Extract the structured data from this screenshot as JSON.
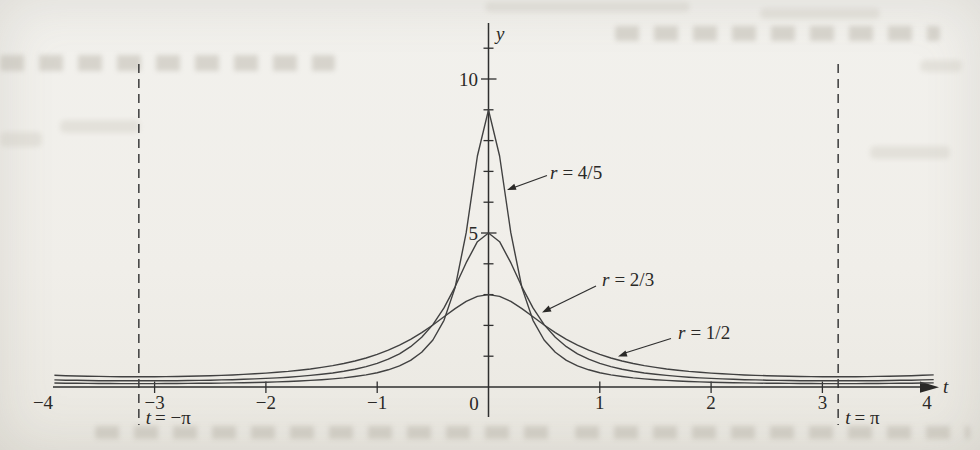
{
  "chart_data": {
    "type": "line",
    "title": "",
    "xlabel": "t",
    "ylabel": "y",
    "xlim": [
      -4,
      4
    ],
    "ylim": [
      0,
      11.8
    ],
    "grid": false,
    "legend_position": "inline-arrow-annotations",
    "x": [
      -4,
      -3.9,
      -3.8,
      -3.7,
      -3.6,
      -3.5,
      -3.4,
      -3.3,
      -3.2,
      -3.1,
      -3,
      -2.9,
      -2.8,
      -2.7,
      -2.6,
      -2.5,
      -2.4,
      -2.3,
      -2.2,
      -2.1,
      -2,
      -1.9,
      -1.8,
      -1.7,
      -1.6,
      -1.5,
      -1.4,
      -1.3,
      -1.2,
      -1.1,
      -1,
      -0.9,
      -0.8,
      -0.7,
      -0.6,
      -0.5,
      -0.4,
      -0.3,
      -0.2,
      -0.1,
      0,
      0.1,
      0.2,
      0.3,
      0.4,
      0.5,
      0.6,
      0.7,
      0.8,
      0.9,
      1,
      1.1,
      1.2,
      1.3,
      1.4,
      1.5,
      1.6,
      1.7,
      1.8,
      1.9,
      2,
      2.1,
      2.2,
      2.3,
      2.4,
      2.5,
      2.6,
      2.7,
      2.8,
      2.9,
      3,
      3.1,
      3.2,
      3.3,
      3.4,
      3.5,
      3.6,
      3.7,
      3.8,
      3.9,
      4
    ],
    "series": [
      {
        "name": "r = 4/5",
        "label_var": "r",
        "label_eq": "= 4/5",
        "peak_y": 9,
        "values": [
          0.134,
          0.129,
          0.124,
          0.12,
          0.117,
          0.115,
          0.113,
          0.112,
          0.111,
          0.111,
          0.112,
          0.113,
          0.114,
          0.117,
          0.12,
          0.123,
          0.128,
          0.133,
          0.139,
          0.147,
          0.156,
          0.167,
          0.18,
          0.195,
          0.213,
          0.236,
          0.263,
          0.297,
          0.34,
          0.394,
          0.464,
          0.558,
          0.685,
          0.865,
          1.127,
          1.526,
          2.166,
          3.228,
          5.011,
          7.5,
          9.0,
          7.5,
          5.011,
          3.228,
          2.166,
          1.526,
          1.127,
          0.865,
          0.685,
          0.558,
          0.464,
          0.394,
          0.34,
          0.297,
          0.263,
          0.236,
          0.213,
          0.195,
          0.18,
          0.167,
          0.156,
          0.147,
          0.139,
          0.133,
          0.128,
          0.123,
          0.12,
          0.117,
          0.114,
          0.113,
          0.112,
          0.111,
          0.111,
          0.112,
          0.113,
          0.115,
          0.117,
          0.12,
          0.124,
          0.129,
          0.134
        ]
      },
      {
        "name": "r = 2/3",
        "label_var": "r",
        "label_eq": "= 2/3",
        "peak_y": 5,
        "values": [
          0.24,
          0.23,
          0.222,
          0.216,
          0.21,
          0.206,
          0.203,
          0.201,
          0.2,
          0.2,
          0.201,
          0.203,
          0.206,
          0.21,
          0.215,
          0.221,
          0.229,
          0.238,
          0.249,
          0.262,
          0.278,
          0.296,
          0.318,
          0.344,
          0.375,
          0.411,
          0.456,
          0.511,
          0.578,
          0.662,
          0.767,
          0.902,
          1.078,
          1.308,
          1.615,
          2.025,
          2.568,
          3.254,
          4.036,
          4.717,
          5.0,
          4.717,
          4.036,
          3.254,
          2.568,
          2.025,
          1.615,
          1.308,
          1.078,
          0.902,
          0.767,
          0.662,
          0.578,
          0.511,
          0.456,
          0.411,
          0.375,
          0.344,
          0.318,
          0.296,
          0.278,
          0.262,
          0.249,
          0.238,
          0.229,
          0.221,
          0.215,
          0.21,
          0.206,
          0.203,
          0.201,
          0.2,
          0.2,
          0.201,
          0.203,
          0.206,
          0.21,
          0.216,
          0.222,
          0.23,
          0.24
        ]
      },
      {
        "name": "r = 1/2",
        "label_var": "r",
        "label_eq": "= 1/2",
        "peak_y": 3,
        "values": [
          0.394,
          0.38,
          0.367,
          0.357,
          0.349,
          0.343,
          0.338,
          0.335,
          0.334,
          0.333,
          0.335,
          0.338,
          0.342,
          0.348,
          0.356,
          0.366,
          0.377,
          0.391,
          0.408,
          0.427,
          0.45,
          0.477,
          0.508,
          0.544,
          0.586,
          0.636,
          0.694,
          0.763,
          0.845,
          0.942,
          1.057,
          1.194,
          1.356,
          1.546,
          1.766,
          2.014,
          2.28,
          2.545,
          2.779,
          2.941,
          3.0,
          2.941,
          2.779,
          2.545,
          2.28,
          2.014,
          1.766,
          1.546,
          1.356,
          1.194,
          1.057,
          0.942,
          0.845,
          0.763,
          0.694,
          0.636,
          0.586,
          0.544,
          0.508,
          0.477,
          0.45,
          0.427,
          0.408,
          0.391,
          0.377,
          0.366,
          0.356,
          0.348,
          0.342,
          0.338,
          0.335,
          0.333,
          0.334,
          0.335,
          0.338,
          0.343,
          0.349,
          0.357,
          0.367,
          0.38,
          0.394
        ]
      }
    ],
    "x_ticks": [
      {
        "value": -4,
        "label": "−4",
        "mark": false
      },
      {
        "value": -3,
        "label": "−3",
        "mark": true
      },
      {
        "value": -2,
        "label": "−2",
        "mark": true
      },
      {
        "value": -1,
        "label": "−1",
        "mark": true
      },
      {
        "value": 0,
        "label": "0",
        "mark": false
      },
      {
        "value": 1,
        "label": "1",
        "mark": true
      },
      {
        "value": 2,
        "label": "2",
        "mark": true
      },
      {
        "value": 3,
        "label": "3",
        "mark": true
      },
      {
        "value": 4,
        "label": "4",
        "mark": false
      }
    ],
    "y_ticks_major": [
      {
        "value": 5,
        "label": "5"
      },
      {
        "value": 10,
        "label": "10"
      }
    ],
    "y_ticks_minor": [
      1,
      2,
      3,
      4,
      6,
      7,
      8,
      9,
      11
    ],
    "asymptotes": [
      {
        "x_value": -3.14159,
        "label_var": "t",
        "label_eq": "= −π"
      },
      {
        "x_value": 3.14159,
        "label_var": "t",
        "label_eq": "= π"
      }
    ]
  }
}
